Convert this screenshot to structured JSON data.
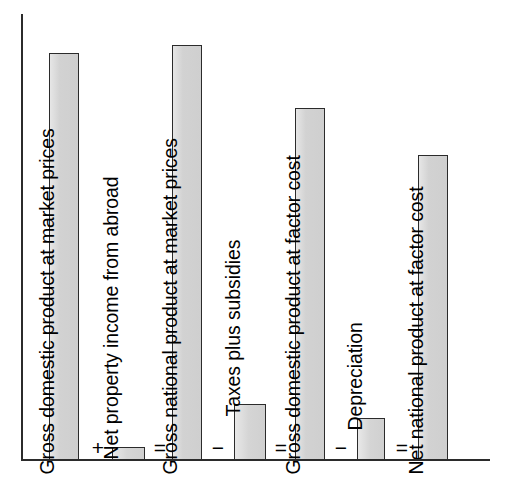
{
  "figure": {
    "kind": "national-accounts-bar-diagram",
    "background_color": "#ffffff",
    "axis_color": "#2b2b2b",
    "bar_fill_color": "#d4d4d4",
    "bar_border_color": "#2b2b2b"
  },
  "chart_data": {
    "type": "bar",
    "title": "",
    "xlabel": "",
    "ylabel": "",
    "grid": false,
    "legend": "none",
    "axis_origin_px": {
      "x": 21,
      "y": 460
    },
    "ylim": [
      0,
      420
    ],
    "categories": [
      "Gross domestic product at market prices",
      "Net property income from abroad",
      "Gross national product at market prices",
      "Taxes plus subsidies",
      "Gross domestic product at factor cost",
      "Depreciation",
      "Net national product at factor cost"
    ],
    "values": [
      407,
      13,
      415,
      56,
      352,
      42,
      305
    ],
    "operators": [
      "+",
      "=",
      "−",
      "=",
      "−",
      "="
    ],
    "annotations": [
      "GDP at market prices + Net property income from abroad = GNP at market prices",
      "GNP at market prices − Taxes plus subsidies = GDP at factor cost",
      "GDP at factor cost − Depreciation = Net national product at factor cost"
    ]
  },
  "bars": [
    {
      "id": "gdp-market-prices",
      "label": "Gross domestic product at market prices",
      "role": "major",
      "x": 49,
      "width": 30,
      "top": 53,
      "height": 407,
      "label_inside": true,
      "label_x": 57,
      "label_baseline": 455
    },
    {
      "id": "net-property-income",
      "label": "Net property income from abroad",
      "role": "minor",
      "x": 112,
      "width": 33,
      "top": 447,
      "height": 13,
      "label_inside": false,
      "label_x": 121,
      "label_baseline": 440
    },
    {
      "id": "gnp-market-prices",
      "label": "Gross national product at market prices",
      "role": "major",
      "x": 172,
      "width": 30,
      "top": 45,
      "height": 415,
      "label_inside": true,
      "label_x": 180,
      "label_baseline": 455
    },
    {
      "id": "taxes-plus-subsidies",
      "label": "Taxes plus subsidies",
      "role": "minor",
      "x": 234,
      "width": 32,
      "top": 404,
      "height": 56,
      "label_inside": false,
      "label_x": 243,
      "label_baseline": 397
    },
    {
      "id": "gdp-factor-cost",
      "label": "Gross domestic product at factor cost",
      "role": "major",
      "x": 295,
      "width": 30,
      "top": 108,
      "height": 352,
      "label_inside": true,
      "label_x": 303,
      "label_baseline": 455
    },
    {
      "id": "depreciation",
      "label": "Depreciation",
      "role": "minor",
      "x": 357,
      "width": 28,
      "top": 418,
      "height": 42,
      "label_inside": false,
      "label_x": 365,
      "label_baseline": 411
    },
    {
      "id": "nnp-factor-cost",
      "label": "Net national product at factor cost",
      "role": "major",
      "x": 418,
      "width": 30,
      "top": 155,
      "height": 305,
      "label_inside": true,
      "label_x": 426,
      "label_baseline": 455
    }
  ],
  "operators": [
    {
      "id": "op-plus-1",
      "symbol": "+",
      "x": 88,
      "y": 437
    },
    {
      "id": "op-equals-1",
      "symbol": "=",
      "x": 150,
      "y": 437
    },
    {
      "id": "op-minus-1",
      "symbol": "−",
      "x": 208,
      "y": 437
    },
    {
      "id": "op-equals-2",
      "symbol": "=",
      "x": 271,
      "y": 437
    },
    {
      "id": "op-minus-2",
      "symbol": "−",
      "x": 331,
      "y": 437
    },
    {
      "id": "op-equals-3",
      "symbol": "=",
      "x": 392,
      "y": 437
    }
  ]
}
